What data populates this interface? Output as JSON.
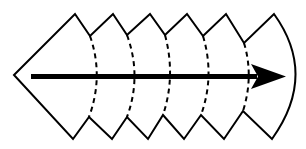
{
  "diagram": {
    "colors": {
      "stroke": "#000000",
      "background": "#ffffff"
    },
    "segments": {
      "count": 6,
      "dividers_style": "dashed",
      "divider_count": 5
    },
    "arrow": {
      "direction": "right"
    }
  }
}
